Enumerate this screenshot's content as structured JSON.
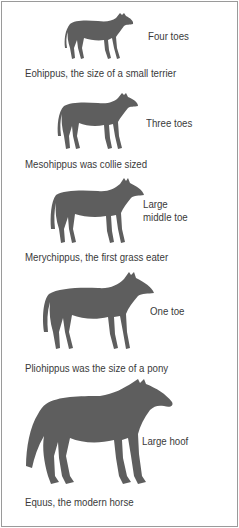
{
  "stages": [
    {
      "name": "Eohippus",
      "toe_label": "Four toes",
      "caption": "Eohippus, the size of a small terrier"
    },
    {
      "name": "Mesohippus",
      "toe_label": "Three toes",
      "caption": "Mesohippus was collie sized"
    },
    {
      "name": "Merychippus",
      "toe_label": "Large\nmiddle toe",
      "toe_label_line1": "Large",
      "toe_label_line2": "middle toe",
      "caption": "Merychippus, the first grass eater"
    },
    {
      "name": "Pliohippus",
      "toe_label": "One toe",
      "caption": "Pliohippus was the size of a pony"
    },
    {
      "name": "Equus",
      "toe_label": "Large hoof",
      "caption": "Equus, the modern horse"
    }
  ],
  "colors": {
    "silhouette": "#5e5e5e",
    "text": "#3a3a3a",
    "border": "#9a9a9a"
  }
}
